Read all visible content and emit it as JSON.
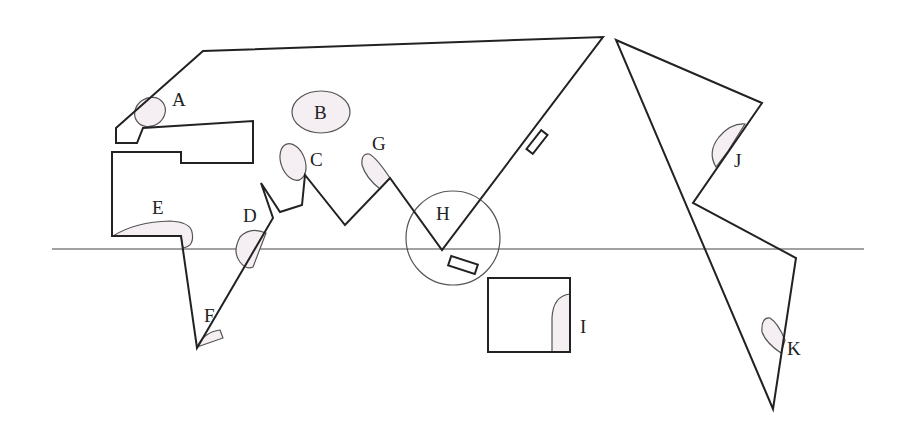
{
  "diagram": {
    "type": "schematic world map with labeled regions",
    "equator_label": "",
    "labels": {
      "A": "A",
      "B": "B",
      "C": "C",
      "D": "D",
      "E": "E",
      "F": "F",
      "G": "G",
      "H": "H",
      "I": "I",
      "J": "J",
      "K": "K"
    },
    "colors": {
      "outline": "#222222",
      "region_fill": "#f5eef2",
      "background": "#ffffff"
    }
  }
}
